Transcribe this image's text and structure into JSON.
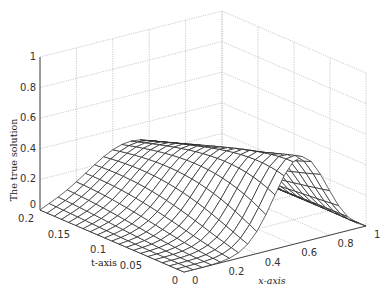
{
  "chart_data": {
    "type": "surface",
    "title": "",
    "zlabel": "The true solution",
    "xlabel": "x-axis",
    "tlabel": "t-axis",
    "x_ticks": [
      "0",
      "0.2",
      "0.4",
      "0.6",
      "0.8",
      "1"
    ],
    "t_ticks": [
      "0",
      "0.05",
      "0.1",
      "0.15",
      "0.2"
    ],
    "z_ticks": [
      "0",
      "0.2",
      "0.4",
      "0.6",
      "0.8",
      "1"
    ],
    "xlim": [
      0,
      1
    ],
    "tlim": [
      0,
      0.2
    ],
    "zlim": [
      0,
      1
    ],
    "grid": true,
    "mesh": {
      "nx": 21,
      "nt": 21
    },
    "surface_description": "Hump-shaped wireframe surface: zero at x=0 and x=1, peak about 0.6 near x=0.65 at t=0, flattening to about 0.3 broad ridge at t=0.2",
    "sample_values": [
      {
        "t": 0,
        "x": 0.65,
        "z": 0.6
      },
      {
        "t": 0.1,
        "x": 0.55,
        "z": 0.38
      },
      {
        "t": 0.2,
        "x": 0.5,
        "z": 0.3
      }
    ]
  }
}
